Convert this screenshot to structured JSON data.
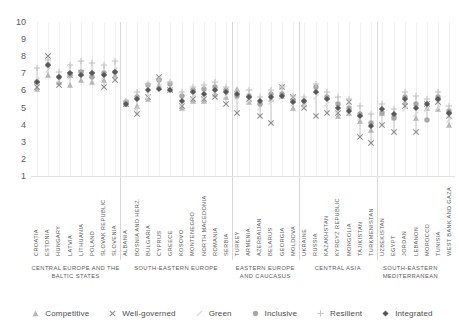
{
  "chart_data": {
    "type": "scatter",
    "title": "",
    "xlabel": "",
    "ylabel": "",
    "ylim": [
      1,
      10
    ],
    "yticks": [
      1,
      2,
      3,
      4,
      5,
      6,
      7,
      8,
      9,
      10
    ],
    "grid": "vertical",
    "legend_position": "bottom",
    "series": [
      {
        "name": "Competitive",
        "marker": "triangle",
        "color": "#b7b7b7"
      },
      {
        "name": "Well-governed",
        "marker": "cross",
        "color": "#8c8c8c"
      },
      {
        "name": "Green",
        "marker": "slash",
        "color": "#d8d8d8"
      },
      {
        "name": "Inclusive",
        "marker": "circle",
        "color": "#a8a8a8"
      },
      {
        "name": "Resilient",
        "marker": "plus",
        "color": "#c4c4c4"
      },
      {
        "name": "Integrated",
        "marker": "diamond",
        "color": "#585858"
      }
    ],
    "groups": [
      {
        "label": "CENTRAL EUROPE AND THE BALTIC STATES",
        "count": 8
      },
      {
        "label": "SOUTH-EASTERN EUROPE",
        "count": 10
      },
      {
        "label": "EASTERN EUROPE AND CAUCASUS",
        "count": 6
      },
      {
        "label": "CENTRAL ASIA",
        "count": 7
      },
      {
        "label": "SOUTH-EASTERN MEDITERRANEAN",
        "count": 6
      }
    ],
    "categories": [
      "CROATIA",
      "ESTONIA",
      "HUNGARY",
      "LATVIA",
      "LITHUANIA",
      "POLAND",
      "SLOVAK REPUBLIC",
      "SLOVENIA",
      "ALBANIA",
      "BOSNIA AND HERZ.",
      "BULGARIA",
      "CYPRUS",
      "GREECE",
      "KOSOVO",
      "MONTENEGRO",
      "NORTH MACEDONIA",
      "ROMANIA",
      "SERBIA",
      "TURKEY",
      "ARMENIA",
      "AZERBAIJAN",
      "BELARUS",
      "GEORGIA",
      "MOLDOVA",
      "UKRAINE",
      "RUSSIA",
      "KAZAKHSTAN",
      "KYRGYZ REPUBLIC",
      "MONGOLIA",
      "TAJIKISTAN",
      "TURKMENISTAN",
      "UZBEKISTAN",
      "EGYPT",
      "JORDAN",
      "LEBANON",
      "MOROCCO",
      "TUNISIA",
      "WEST BANK AND GAZA"
    ],
    "points": {
      "Competitive": [
        6.1,
        6.9,
        6.5,
        6.3,
        6.6,
        6.5,
        6.6,
        6.9,
        5.2,
        5.1,
        5.5,
        6.3,
        6.1,
        5.0,
        5.4,
        5.4,
        5.8,
        5.6,
        6.1,
        5.3,
        5.3,
        5.5,
        5.7,
        5.0,
        5.2,
        6.0,
        5.6,
        4.5,
        4.7,
        4.2,
        3.7,
        4.7,
        4.6,
        5.3,
        4.4,
        5.0,
        4.9,
        4.0
      ],
      "Well-governed": [
        6.2,
        8.0,
        6.3,
        6.9,
        7.0,
        6.9,
        6.2,
        6.6,
        5.2,
        4.6,
        5.6,
        6.8,
        6.0,
        5.1,
        5.5,
        5.5,
        5.6,
        5.2,
        4.7,
        5.5,
        4.5,
        4.1,
        6.2,
        5.6,
        5.0,
        4.5,
        4.7,
        4.7,
        5.3,
        3.3,
        2.9,
        4.0,
        3.6,
        5.1,
        3.6,
        5.2,
        5.3,
        4.5
      ],
      "Green": [
        6.6,
        7.2,
        6.6,
        6.8,
        6.9,
        7.0,
        6.8,
        7.2,
        5.3,
        5.0,
        5.6,
        6.2,
        6.0,
        5.2,
        5.6,
        5.6,
        5.9,
        5.7,
        5.6,
        5.4,
        5.0,
        5.3,
        5.6,
        5.2,
        5.1,
        5.6,
        5.2,
        4.8,
        4.8,
        4.4,
        4.0,
        4.6,
        4.4,
        4.9,
        4.6,
        4.9,
        5.0,
        4.3
      ],
      "Inclusive": [
        6.5,
        7.5,
        6.8,
        6.9,
        7.1,
        6.8,
        7.0,
        7.1,
        5.3,
        5.6,
        6.3,
        6.6,
        6.4,
        5.7,
        6.0,
        6.1,
        6.2,
        6.0,
        5.7,
        5.7,
        5.2,
        5.8,
        5.8,
        5.4,
        5.4,
        6.2,
        5.6,
        5.2,
        5.0,
        4.6,
        4.1,
        4.7,
        4.4,
        5.6,
        5.2,
        4.3,
        5.6,
        4.8
      ],
      "Resilient": [
        7.3,
        7.8,
        7.1,
        7.5,
        7.7,
        7.6,
        7.5,
        7.7,
        5.4,
        5.9,
        6.4,
        6.6,
        6.5,
        5.9,
        6.2,
        6.3,
        6.5,
        6.2,
        5.9,
        6.0,
        5.6,
        6.0,
        6.2,
        5.7,
        5.6,
        6.4,
        5.9,
        5.6,
        5.5,
        5.1,
        4.6,
        5.2,
        4.9,
        5.9,
        5.7,
        5.5,
        5.9,
        5.1
      ],
      "Integrated": [
        6.5,
        7.5,
        6.8,
        7.0,
        6.9,
        7.0,
        6.9,
        7.1,
        5.2,
        5.5,
        6.0,
        6.1,
        6.0,
        5.4,
        5.9,
        5.8,
        6.0,
        5.9,
        5.8,
        5.6,
        5.4,
        5.6,
        5.7,
        5.3,
        5.4,
        5.9,
        5.5,
        5.0,
        4.8,
        4.5,
        3.9,
        4.9,
        4.6,
        5.5,
        5.0,
        5.2,
        5.5,
        4.7
      ]
    }
  }
}
